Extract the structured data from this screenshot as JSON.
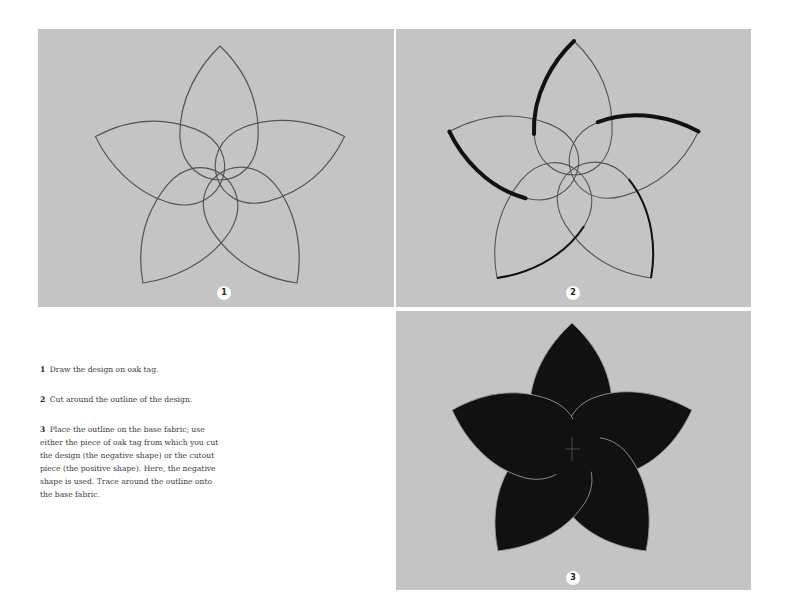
{
  "figures": [
    {
      "id": "panel-1",
      "badge": "1",
      "description": "Five-petal flower design outlined in pencil on oak tag"
    },
    {
      "id": "panel-2",
      "badge": "2",
      "description": "Oak tag cut around the outline of the design"
    },
    {
      "id": "panel-3",
      "badge": "3",
      "description": "Negative shape outline placed on dark base fabric"
    }
  ],
  "steps": [
    {
      "number": "1",
      "text": "Draw the design on oak tag."
    },
    {
      "number": "2",
      "text": "Cut around the outline of the design."
    },
    {
      "number": "3",
      "text": "Place the outline on the base fabric; use either the piece of oak tag from which you cut the design (the negative shape) or the cutout piece (the positive shape). Here, the negative shape is used. Trace around the outline onto the base fabric."
    }
  ],
  "colors": {
    "panel_background": "#c4c4c4",
    "pencil_line": "#555555",
    "fabric": "#111111",
    "badge_background": "#ffffff"
  }
}
